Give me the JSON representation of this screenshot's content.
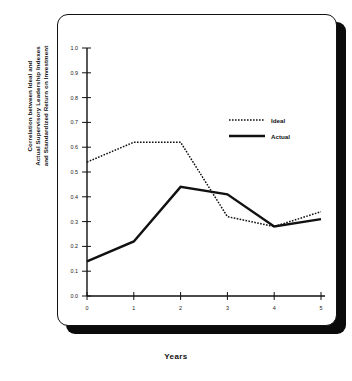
{
  "chart_data": {
    "type": "line",
    "title": "",
    "xlabel": "Years",
    "ylabel": "Correlation between Ideal and\nActual Supervisory Leadership Indexes\nand Standardized Return on Investment",
    "x": [
      0,
      1,
      2,
      3,
      4,
      5
    ],
    "xtick_labels": [
      "0",
      "1",
      "2",
      "3",
      "4",
      "5"
    ],
    "ytick_labels": [
      "0.0",
      "0.1",
      "0.2",
      "0.3",
      "0.4",
      "0.5",
      "0.6",
      "0.7",
      "0.8",
      "0.9",
      "1.0"
    ],
    "ytick_values": [
      0.0,
      0.1,
      0.2,
      0.3,
      0.4,
      0.5,
      0.6,
      0.7,
      0.8,
      0.9,
      1.0
    ],
    "xlim": [
      0,
      5
    ],
    "ylim": [
      0.0,
      1.0
    ],
    "grid": false,
    "legend_position": "upper right",
    "series": [
      {
        "name": "Ideal",
        "style": "dotted",
        "color": "#111111",
        "values": [
          0.54,
          0.62,
          0.62,
          0.32,
          0.28,
          0.34
        ]
      },
      {
        "name": "Actual",
        "style": "solid",
        "color": "#111111",
        "values": [
          0.14,
          0.22,
          0.44,
          0.41,
          0.28,
          0.31
        ]
      }
    ]
  },
  "legend": {
    "items": [
      {
        "label": "Ideal"
      },
      {
        "label": "Actual"
      }
    ]
  },
  "axes": {
    "x_title": "Years",
    "y_title_line1": "Correlation between Ideal and",
    "y_title_line2": "Actual Supervisory Leadership Indexes",
    "y_title_line3": "and Standardized Return on Investment"
  }
}
